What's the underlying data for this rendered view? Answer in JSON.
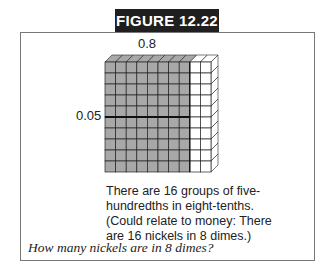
{
  "figure": {
    "label": "FIGURE 12.22",
    "top_label": "0.8",
    "side_label": "0.05",
    "grid": {
      "rows": 10,
      "cols": 10,
      "shaded_cols": 8,
      "divider_after_row": 5,
      "shade_color": "#a8a8a8",
      "line_color": "#222222"
    },
    "description_lines": [
      "There are 16 groups of five-",
      "hundredths in eight-tenths.",
      "(Could relate to money: There",
      "are 16 nickels in 8 dimes.)"
    ],
    "question": "How many nickels are in 8 dimes?"
  }
}
